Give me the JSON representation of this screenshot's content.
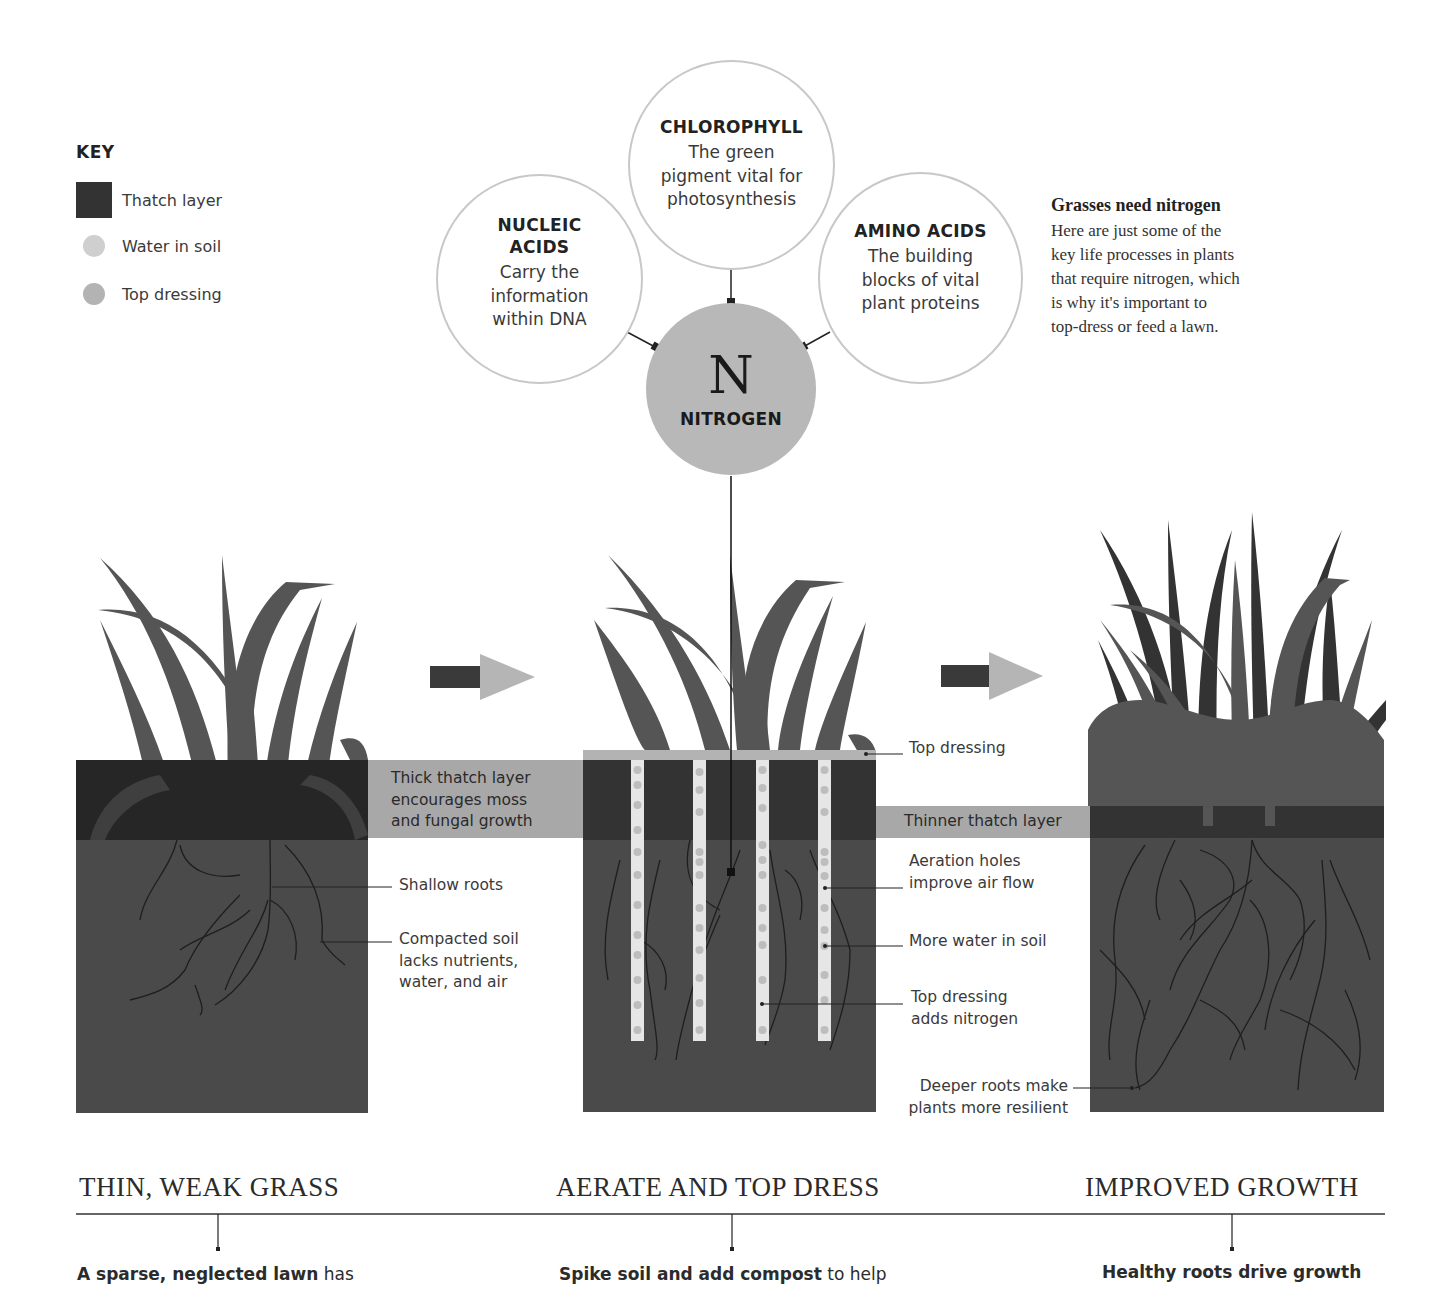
{
  "key": {
    "title": "KEY",
    "items": [
      {
        "label": "Thatch layer",
        "shape": "square",
        "color": "#333333"
      },
      {
        "label": "Water in soil",
        "shape": "dot",
        "color": "#cfcfcf"
      },
      {
        "label": "Top dressing",
        "shape": "dot",
        "color": "#b3b3b3"
      }
    ]
  },
  "nitrogen": {
    "symbol": "N",
    "label": "NITROGEN",
    "processes": [
      {
        "id": "chlorophyll",
        "title": "CHLOROPHYLL",
        "lines": [
          "The green",
          "pigment vital for",
          "photosynthesis"
        ]
      },
      {
        "id": "nucleic-acids",
        "title": "NUCLEIC ACIDS",
        "title_lines": [
          "NUCLEIC",
          "ACIDS"
        ],
        "lines": [
          "Carry the",
          "information",
          "within DNA"
        ]
      },
      {
        "id": "amino-acids",
        "title": "AMINO ACIDS",
        "lines": [
          "The building",
          "blocks of vital",
          "plant proteins"
        ]
      }
    ]
  },
  "intro": {
    "title": "Grasses need nitrogen",
    "lines": [
      "Here are just some of the",
      "key life processes in plants",
      "that require nitrogen, which",
      "is why it's important to",
      "top-dress or feed a lawn."
    ]
  },
  "annotations": {
    "thick_thatch": [
      "Thick thatch layer",
      "encourages moss",
      "and fungal growth"
    ],
    "shallow_roots": "Shallow roots",
    "compacted_soil": [
      "Compacted soil",
      "lacks nutrients,",
      "water, and air"
    ],
    "top_dressing": "Top dressing",
    "thinner_thatch": "Thinner thatch layer",
    "aeration_holes": [
      "Aeration holes",
      "improve air flow"
    ],
    "more_water": "More water in soil",
    "top_dressing_nitrogen": [
      "Top dressing",
      "adds nitrogen"
    ],
    "deeper_roots": [
      "Deeper roots make",
      "plants more resilient"
    ]
  },
  "stages": [
    {
      "heading": "THIN, WEAK GRASS",
      "caption_bold": "A sparse, neglected lawn",
      "caption_rest": " has"
    },
    {
      "heading": "AERATE AND TOP DRESS",
      "caption_bold": "Spike soil and add compost",
      "caption_rest": " to help"
    },
    {
      "heading": "IMPROVED GROWTH",
      "caption_bold": "Healthy roots drive growth",
      "caption_rest": ""
    }
  ],
  "colors": {
    "soil": "#4a4a4a",
    "thatch": "#333333",
    "thatch_dark": "#1e1e1e",
    "grass": "#555555",
    "grass_dark": "#3a3a3a",
    "band": "#a8a8a8",
    "top_dressing": "#b3b3b3",
    "water": "#d8d8d8",
    "nitrogen_fill": "#b8b8b8",
    "circle_border": "#c8c8c8",
    "arrow_body": "#3a3a3a",
    "arrow_head": "#b5b5b5"
  }
}
